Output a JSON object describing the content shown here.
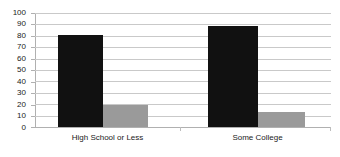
{
  "chart_data": {
    "type": "bar",
    "title": "",
    "subtitle": "",
    "xlabel": "",
    "ylabel": "",
    "categories": [
      "High School or Less",
      "Some College"
    ],
    "series": [
      {
        "name": "Series 1",
        "color": "#111111",
        "values": [
          81,
          89
        ]
      },
      {
        "name": "Series 2",
        "color": "#9a9a9a",
        "values": [
          19,
          13
        ]
      }
    ],
    "ylim": [
      0,
      100
    ],
    "ytick_step": 10,
    "yticks": [
      0,
      10,
      20,
      30,
      40,
      50,
      60,
      70,
      80,
      90,
      100
    ],
    "ytick_labels": [
      "0",
      "10",
      "20",
      "30",
      "40",
      "50",
      "60",
      "70",
      "80",
      "90",
      "100"
    ],
    "grid": true,
    "grid_axis": "y",
    "grid_color": "#c9c9c9",
    "legend": false,
    "legend_position": "none",
    "annotations": [],
    "axis_color": "#b0b0b0",
    "text_color": "#1a1a1a",
    "background": "#ffffff"
  }
}
